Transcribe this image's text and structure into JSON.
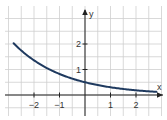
{
  "chart_data": {
    "type": "line",
    "title": "",
    "xlabel": "x",
    "ylabel": "y",
    "xlim": [
      -3.2,
      3.0
    ],
    "ylim": [
      -0.85,
      3.7
    ],
    "grid": true,
    "grid_step": 0.5,
    "x_ticks": [
      -2,
      -1,
      1,
      2
    ],
    "x_tick_labels": [
      "−2",
      "−1",
      "1",
      "2"
    ],
    "y_ticks": [
      1,
      2
    ],
    "y_tick_labels": [
      "1",
      "2"
    ],
    "series": [
      {
        "name": "exponential decay",
        "function": "y = 0.5 * e^(-0.5x)",
        "color": "#1f3a5f",
        "x": [
          -2.8,
          -2.5,
          -2,
          -1.5,
          -1,
          -0.5,
          0,
          0.5,
          1,
          1.5,
          2,
          2.5,
          2.8
        ],
        "values": [
          2.03,
          1.75,
          1.36,
          1.06,
          0.82,
          0.64,
          0.5,
          0.39,
          0.3,
          0.24,
          0.18,
          0.14,
          0.12
        ]
      }
    ],
    "legend": "none"
  },
  "colors": {
    "grid": "#cfcfcf",
    "axis": "#222222",
    "curve": "#1f3a5f"
  }
}
